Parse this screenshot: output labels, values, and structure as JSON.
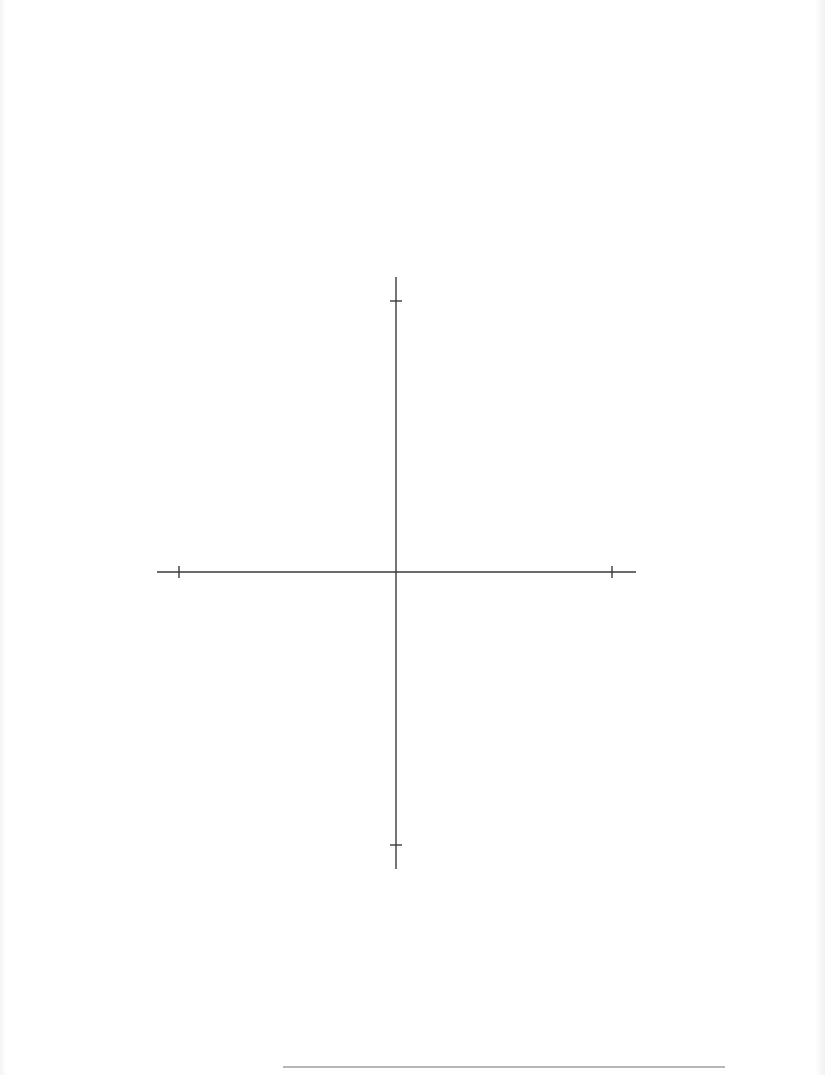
{
  "page": {
    "width": 825,
    "height": 1075,
    "background": "#ffffff",
    "ink_color": "#3a3a3a",
    "rule_color": "#6e6e6e"
  },
  "figure": {
    "type": "coordinate-axes",
    "origin": {
      "x": 396,
      "y": 572
    },
    "x_axis": {
      "x1": 157,
      "x2": 636,
      "y": 572,
      "ticks": [
        179,
        612
      ],
      "tick_half_length": 6
    },
    "y_axis": {
      "x": 396,
      "y1": 277,
      "y2": 869,
      "ticks": [
        301,
        845
      ],
      "tick_half_length": 6
    },
    "labels": []
  },
  "footnote_rule": {
    "x1": 283,
    "x2": 725,
    "y": 1067
  }
}
